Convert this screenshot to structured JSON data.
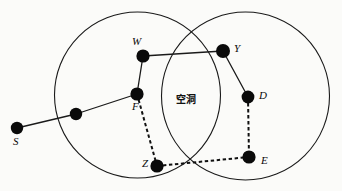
{
  "figure": {
    "background_color": "#fbfbf9",
    "stroke_color": "#1a1a1a",
    "node_color": "#0a0a0a",
    "width": 342,
    "height": 191
  },
  "regions": [
    {
      "name": "left-coverage-circle",
      "cx": 137.5,
      "cy": 95,
      "r": 83
    },
    {
      "name": "right-coverage-circle",
      "cx": 245.5,
      "cy": 96,
      "r": 84
    }
  ],
  "void_label": {
    "text": "空洞",
    "x": 186,
    "y": 103
  },
  "nodes": [
    {
      "id": "S",
      "label": "S",
      "x": 17,
      "y": 128,
      "r": 6.2,
      "label_x": 13,
      "label_y": 145,
      "labelled": true
    },
    {
      "id": "N1",
      "label": "",
      "x": 76,
      "y": 114,
      "r": 6.2,
      "label_x": 0,
      "label_y": 0,
      "labelled": false
    },
    {
      "id": "F",
      "label": "F",
      "x": 137,
      "y": 94,
      "r": 6.6,
      "label_x": 132,
      "label_y": 110,
      "labelled": true
    },
    {
      "id": "W",
      "label": "W",
      "x": 143,
      "y": 56,
      "r": 6.6,
      "label_x": 132,
      "label_y": 45,
      "labelled": true
    },
    {
      "id": "Y",
      "label": "Y",
      "x": 223,
      "y": 51,
      "r": 7.0,
      "label_x": 234,
      "label_y": 52,
      "labelled": true
    },
    {
      "id": "D",
      "label": "D",
      "x": 248,
      "y": 97,
      "r": 6.4,
      "label_x": 259,
      "label_y": 99,
      "labelled": true
    },
    {
      "id": "Z",
      "label": "Z",
      "x": 157,
      "y": 166,
      "r": 6.6,
      "label_x": 142,
      "label_y": 167,
      "labelled": true
    },
    {
      "id": "E",
      "label": "E",
      "x": 249,
      "y": 157,
      "r": 6.6,
      "label_x": 261,
      "label_y": 164,
      "labelled": true
    }
  ],
  "edges": [
    {
      "from": "S",
      "to": "N1",
      "style": "solid"
    },
    {
      "from": "N1",
      "to": "F",
      "style": "solid"
    },
    {
      "from": "F",
      "to": "W",
      "style": "solid"
    },
    {
      "from": "W",
      "to": "Y",
      "style": "solid"
    },
    {
      "from": "Y",
      "to": "D",
      "style": "solid"
    },
    {
      "from": "F",
      "to": "Z",
      "style": "dashed"
    },
    {
      "from": "Z",
      "to": "E",
      "style": "dashed"
    },
    {
      "from": "D",
      "to": "E",
      "style": "dashed"
    }
  ]
}
